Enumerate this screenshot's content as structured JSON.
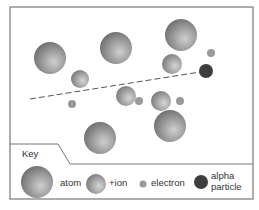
{
  "diagram": {
    "frame": {
      "x": 10,
      "y": 7,
      "w": 243,
      "h": 192,
      "stroke": "#777777"
    },
    "colors": {
      "atom_light": "#c8c8c8",
      "atom_dark": "#6e6e6e",
      "ion_light": "#d0d0d0",
      "ion_dark": "#7a7a7a",
      "electron": "#9a9a9a",
      "alpha": "#3e3e3e",
      "path": "#555555"
    },
    "atoms": [
      {
        "cx": 50,
        "cy": 58,
        "r": 16
      },
      {
        "cx": 116,
        "cy": 48,
        "r": 16
      },
      {
        "cx": 181,
        "cy": 35,
        "r": 16
      },
      {
        "cx": 100,
        "cy": 138,
        "r": 16
      },
      {
        "cx": 170,
        "cy": 126,
        "r": 16
      }
    ],
    "ions": [
      {
        "cx": 80,
        "cy": 79,
        "r": 9
      },
      {
        "cx": 172,
        "cy": 64,
        "r": 10
      },
      {
        "cx": 126,
        "cy": 96,
        "r": 10
      },
      {
        "cx": 161,
        "cy": 101,
        "r": 10
      }
    ],
    "electrons": [
      {
        "cx": 211,
        "cy": 53,
        "r": 4
      },
      {
        "cx": 72,
        "cy": 104,
        "r": 4
      },
      {
        "cx": 139,
        "cy": 101,
        "r": 4
      },
      {
        "cx": 180,
        "cy": 101,
        "r": 4
      }
    ],
    "alpha_particle": {
      "cx": 206,
      "cy": 71,
      "r": 7
    },
    "alpha_path": {
      "x1": 30,
      "y1": 99,
      "x2": 200,
      "y2": 72
    }
  },
  "key": {
    "title": "Key",
    "items": [
      {
        "type": "atom",
        "label": "atom"
      },
      {
        "type": "ion",
        "label": "+ion"
      },
      {
        "type": "electron",
        "label": "electron"
      },
      {
        "type": "alpha",
        "label_line1": "alpha",
        "label_line2": "particle"
      }
    ]
  }
}
